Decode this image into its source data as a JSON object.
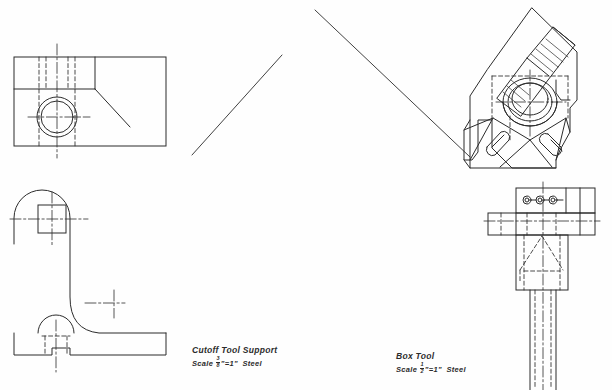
{
  "sheet": {
    "kind": "engineering-drawing-sheet",
    "background_color": "#fefefe",
    "line_color": "#2b2b2b",
    "width": 612,
    "height": 390
  },
  "captions": [
    {
      "id": "cutoff-tool-support",
      "title": "Cutoff Tool Support",
      "scale_prefix": "Scale",
      "scale_numerator": "3",
      "scale_denominator": "8",
      "scale_unit_mark": "\"",
      "scale_equals": "=",
      "scale_right": "1\"",
      "material": "Steel"
    },
    {
      "id": "box-tool",
      "title": "Box Tool",
      "scale_prefix": "Scale",
      "scale_numerator": "1",
      "scale_denominator": "2",
      "scale_unit_mark": "\"",
      "scale_equals": "=",
      "scale_right": "1\"",
      "material": "Steel"
    }
  ],
  "views": [
    {
      "id": "cutoff-top-view",
      "label": "top view - cutoff tool support",
      "projection": "orthographic-top",
      "features": [
        "rectangular-outline",
        "hidden-slot-lines",
        "bored-hole-circles",
        "center-lines",
        "chamfer-leader"
      ]
    },
    {
      "id": "cutoff-front-view",
      "label": "front view - cutoff tool support",
      "projection": "orthographic-front",
      "features": [
        "rounded-top-arc",
        "square-hole",
        "fillet-curve",
        "base-plate",
        "semicircular-notch",
        "hidden-lines",
        "center-lines"
      ]
    },
    {
      "id": "boxtool-isometric",
      "label": "isometric pictorial - box tool",
      "projection": "isometric",
      "features": [
        "central-bore",
        "angled-knurled-boss",
        "slotted-lugs",
        "hidden-lines",
        "center-lines"
      ]
    },
    {
      "id": "boxtool-front-view",
      "label": "front view - box tool",
      "projection": "orthographic-front",
      "features": [
        "top-bar-with-holes",
        "cross-arm",
        "tapered-body",
        "round-shank",
        "hidden-lines",
        "center-line"
      ]
    }
  ],
  "leader_lines": [
    {
      "id": "leader-left",
      "direction": "up-right"
    },
    {
      "id": "leader-right",
      "direction": "down-right"
    }
  ]
}
